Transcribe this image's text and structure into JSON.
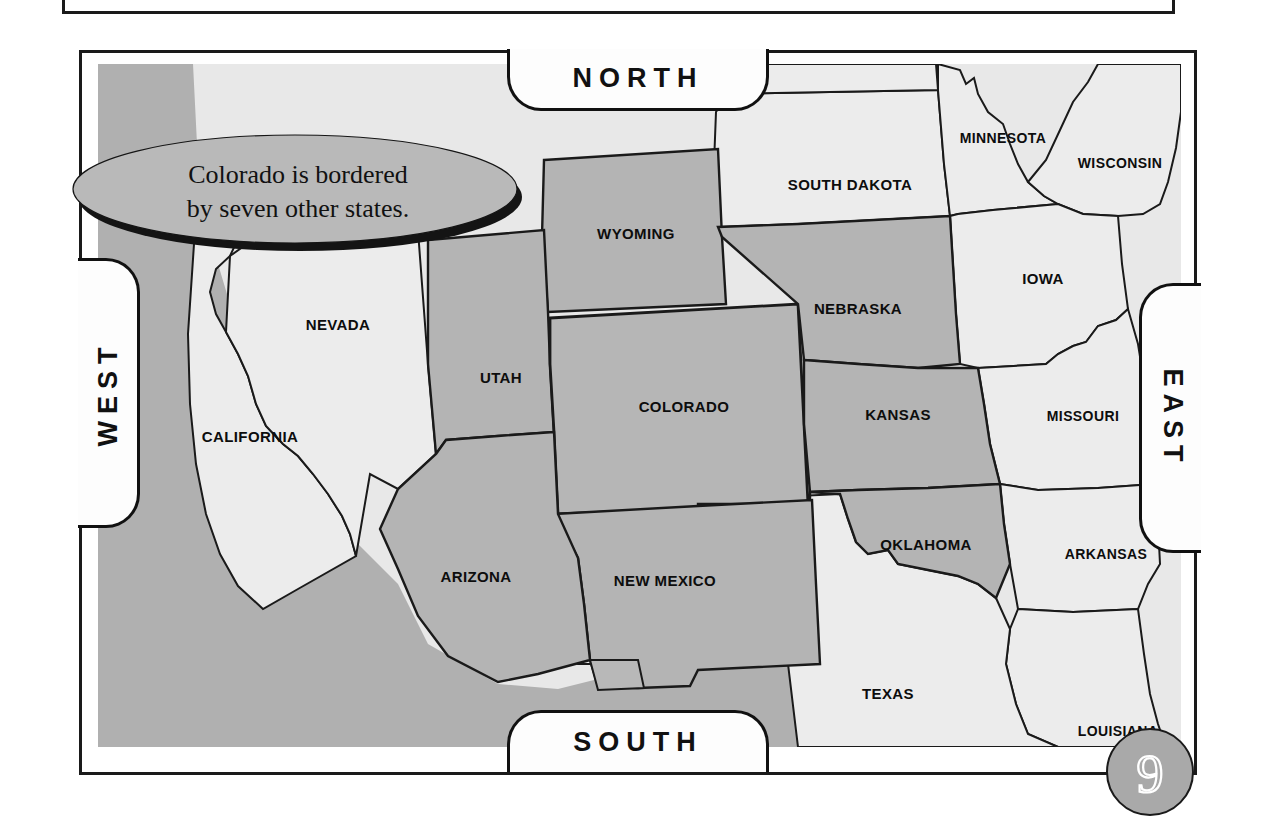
{
  "page": {
    "number": "9"
  },
  "callout": {
    "line1": "Colorado is bordered",
    "line2": "by seven other states."
  },
  "compass": {
    "north": "NORTH",
    "south": "SOUTH",
    "east": "EAST",
    "west": "WEST"
  },
  "colors": {
    "highlight_state": "#b3b3b3",
    "plain_state": "#e8e8e8",
    "ocean": "#b0b0b0",
    "border": "#1a1a1a",
    "callout_fill": "#b8b8b8",
    "badge_fill": "#a9a9a9"
  },
  "map": {
    "focus_state": "COLORADO",
    "bordering_count": 7,
    "states": [
      {
        "name": "COLORADO",
        "label": "COLORADO",
        "x": 586,
        "y": 343,
        "bordering": true,
        "focus": true
      },
      {
        "name": "WYOMING",
        "label": "WYOMING",
        "x": 545,
        "y": 170,
        "bordering": true,
        "focus": false
      },
      {
        "name": "NEBRASKA",
        "label": "NEBRASKA",
        "x": 760,
        "y": 246,
        "bordering": true,
        "focus": false
      },
      {
        "name": "KANSAS",
        "label": "KANSAS",
        "x": 800,
        "y": 350,
        "bordering": true,
        "focus": false
      },
      {
        "name": "OKLAHOMA",
        "label": "OKLAHOMA",
        "x": 828,
        "y": 481,
        "bordering": true,
        "focus": false
      },
      {
        "name": "NEW MEXICO",
        "label": "NEW MEXICO",
        "x": 567,
        "y": 517,
        "bordering": true,
        "focus": false
      },
      {
        "name": "ARIZONA",
        "label": "ARIZONA",
        "x": 378,
        "y": 512,
        "bordering": true,
        "focus": false
      },
      {
        "name": "UTAH",
        "label": "UTAH",
        "x": 403,
        "y": 314,
        "bordering": true,
        "focus": false
      },
      {
        "name": "NEVADA",
        "label": "NEVADA",
        "x": 240,
        "y": 261,
        "bordering": false,
        "focus": false
      },
      {
        "name": "CALIFORNIA",
        "label": "CALIFORNIA",
        "x": 146,
        "y": 373,
        "bordering": false,
        "focus": false
      },
      {
        "name": "SOUTH DAKOTA",
        "label": "SOUTH DAKOTA",
        "x": 750,
        "y": 122,
        "bordering": false,
        "focus": false
      },
      {
        "name": "MINNESOTA",
        "label": "MINNESOTA",
        "x": 905,
        "y": 75,
        "bordering": false,
        "focus": false
      },
      {
        "name": "WISCONSIN",
        "label": "WISCONSIN",
        "x": 1022,
        "y": 100,
        "bordering": false,
        "focus": false
      },
      {
        "name": "IOWA",
        "label": "IOWA",
        "x": 945,
        "y": 215,
        "bordering": false,
        "focus": false
      },
      {
        "name": "MISSOURI",
        "label": "MISSOURI",
        "x": 985,
        "y": 352,
        "bordering": false,
        "focus": false
      },
      {
        "name": "ARKANSAS",
        "label": "ARKANSAS",
        "x": 1010,
        "y": 490,
        "bordering": false,
        "focus": false
      },
      {
        "name": "LOUISIANA",
        "label": "LOUISIANA",
        "x": 1022,
        "y": 667,
        "bordering": false,
        "focus": false
      },
      {
        "name": "TEXAS",
        "label": "TEXAS",
        "x": 790,
        "y": 630,
        "bordering": false,
        "focus": false
      }
    ]
  }
}
